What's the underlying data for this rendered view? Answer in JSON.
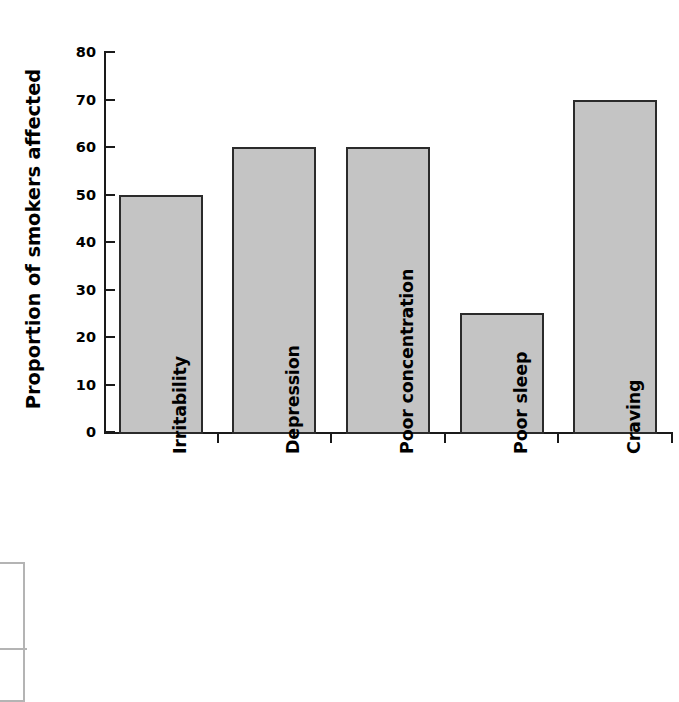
{
  "chart_data": {
    "type": "bar",
    "title": "",
    "subtitle": "",
    "xlabel": "",
    "ylabel": "Proportion of smokers affected",
    "ylim": [
      0,
      80
    ],
    "yticks": [
      0,
      10,
      20,
      30,
      40,
      50,
      60,
      70,
      80
    ],
    "ytick_labels": [
      "0",
      "10",
      "20",
      "30",
      "40",
      "50",
      "60",
      "70",
      "80"
    ],
    "grid": false,
    "legend": false,
    "legend_position": "none",
    "categories": [
      "Irritability",
      "Depression",
      "Poor concentration",
      "Poor sleep",
      "Craving"
    ],
    "values": [
      50,
      60,
      60,
      25,
      70
    ],
    "bar_fill_color": "#c4c4c4",
    "bar_edge_color": "#2b2b2b",
    "axis_color": "#1a1a1a",
    "background_color": "#ffffff",
    "xtick_label_rotation": 90,
    "ylabel_rotation": 90
  },
  "fragment": {
    "name": "cropped-table-fragment",
    "border_color": "#b4b4b4"
  }
}
